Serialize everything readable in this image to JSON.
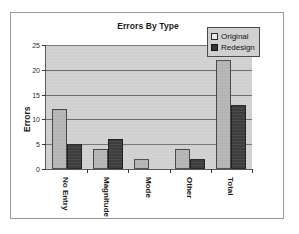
{
  "chart": {
    "title": "Errors By Type",
    "ylabel": "Errors"
  },
  "legend": {
    "items": [
      {
        "label": "Original",
        "swatch": "legend-swatch-original",
        "color": "#b4b4b4"
      },
      {
        "label": "Redesign",
        "swatch": "legend-swatch-redesign",
        "color": "#3d3d3d"
      }
    ]
  },
  "axis": {
    "y_ticks": [
      "0",
      "5",
      "10",
      "15",
      "20",
      "25"
    ],
    "x_ticks": [
      "No Entry",
      "Magnitude",
      "Mode",
      "Other",
      "Total"
    ]
  },
  "chart_data": {
    "type": "bar",
    "title": "Errors By Type",
    "subtitle": "",
    "xlabel": "",
    "ylabel": "Errors",
    "categories": [
      "No Entry",
      "Magnitude",
      "Mode",
      "Other",
      "Total"
    ],
    "series": [
      {
        "name": "Original",
        "color": "#b4b4b4",
        "values": [
          12,
          4,
          2,
          4,
          22
        ]
      },
      {
        "name": "Redesign",
        "color": "#3d3d3d",
        "values": [
          5,
          6,
          0,
          2,
          13
        ]
      }
    ],
    "ylim": [
      0,
      25
    ],
    "ytick_interval": 5,
    "ytick_labels": [
      "0",
      "5",
      "10",
      "15",
      "20",
      "25"
    ],
    "grid": "horizontal",
    "legend_position": "top-right-inside",
    "plot_background": "#d0d0d0",
    "annotations": []
  }
}
